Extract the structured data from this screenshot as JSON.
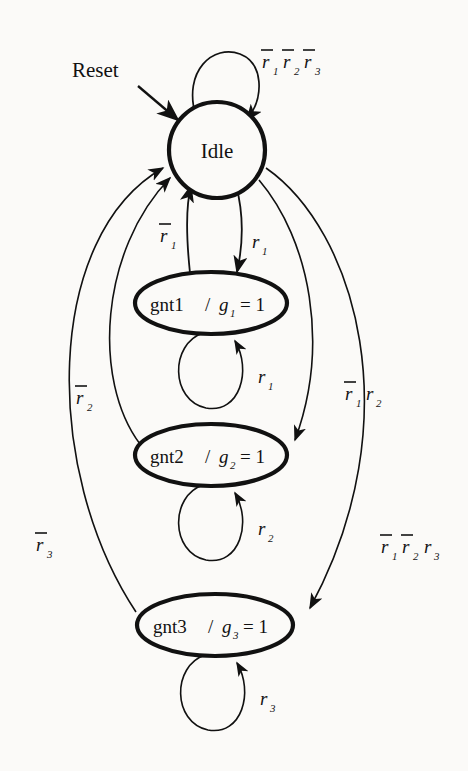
{
  "diagram": {
    "type": "finite-state-machine",
    "background_color": "#fbfaf8",
    "stroke_color": "#111111",
    "states": [
      {
        "id": "idle",
        "label": "Idle",
        "shape": "circle",
        "cx": 217,
        "cy": 150,
        "rx": 48,
        "ry": 36,
        "self_loop_label": "r1bar r2bar r3bar",
        "self_loop_text": "r̄₁r̄₂r̄₃"
      },
      {
        "id": "gnt1",
        "label": "gnt1 / g",
        "output_var": "g",
        "output_sub": "1",
        "output_value": "= 1",
        "shape": "ellipse",
        "cx": 211,
        "cy": 303,
        "rx": 76,
        "ry": 31,
        "self_loop_text": "r₁"
      },
      {
        "id": "gnt2",
        "label": "gnt2/ g",
        "output_var": "g",
        "output_sub": "2",
        "output_value": "= 1",
        "shape": "ellipse",
        "cx": 211,
        "cy": 455,
        "rx": 76,
        "ry": 31,
        "self_loop_text": "r₂"
      },
      {
        "id": "gnt3",
        "label": "gnt3/ g",
        "output_var": "g",
        "output_sub": "3",
        "output_value": "= 1",
        "shape": "ellipse",
        "cx": 215,
        "cy": 625,
        "rx": 78,
        "ry": 31,
        "self_loop_text": "r₃"
      }
    ],
    "reset_label": "Reset",
    "edge_labels": {
      "idle_self": "r̄1 r̄2 r̄3",
      "gnt1_to_idle": "r̄1",
      "idle_to_gnt1": "r1",
      "gnt1_self": "r1",
      "gnt2_to_idle": "r̄2",
      "idle_to_gnt2": "r̄1 r2",
      "gnt2_self": "r2",
      "gnt3_to_idle": "r̄3",
      "idle_to_gnt3": "r̄1 r̄2 r3",
      "gnt3_self": "r3"
    },
    "labels": {
      "r": "r",
      "g": "g",
      "one": "1",
      "two": "2",
      "three": "3",
      "eq1": "= 1",
      "slash": "/",
      "gnt1_name": "gnt1",
      "gnt2_name": "gnt2",
      "gnt3_name": "gnt3",
      "idle_name": "Idle",
      "reset": "Reset"
    },
    "transitions": [
      {
        "from": "idle",
        "to": "idle",
        "condition": "r̄1r̄2r̄3"
      },
      {
        "from": "idle",
        "to": "gnt1",
        "condition": "r1"
      },
      {
        "from": "gnt1",
        "to": "idle",
        "condition": "r̄1"
      },
      {
        "from": "gnt1",
        "to": "gnt1",
        "condition": "r1"
      },
      {
        "from": "idle",
        "to": "gnt2",
        "condition": "r̄1r2"
      },
      {
        "from": "gnt2",
        "to": "idle",
        "condition": "r̄2"
      },
      {
        "from": "gnt2",
        "to": "gnt2",
        "condition": "r2"
      },
      {
        "from": "idle",
        "to": "gnt3",
        "condition": "r̄1r̄2r3"
      },
      {
        "from": "gnt3",
        "to": "idle",
        "condition": "r̄3"
      },
      {
        "from": "gnt3",
        "to": "gnt3",
        "condition": "r3"
      }
    ]
  }
}
